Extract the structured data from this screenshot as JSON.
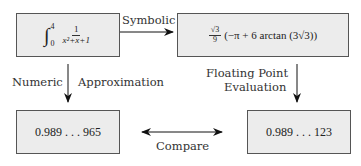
{
  "nodes": {
    "integral": {
      "symbol": "∫",
      "upper": "4",
      "lower": "0",
      "numerator": "1",
      "denominator": "x²+x+1"
    },
    "symbolic_result": {
      "coef_numerator": "√3",
      "coef_denominator": "9",
      "expression": "(−π + 6 arctan (3√3))"
    },
    "numeric_value": "0.989 . . . 965",
    "float_value": "0.989 . . . 123"
  },
  "edges": {
    "symbolic": "Symbolic",
    "numeric": "Numeric",
    "approximation": "Approximation",
    "floating_point_line1": "Floating Point",
    "floating_point_line2": "Evaluation",
    "compare": "Compare"
  }
}
